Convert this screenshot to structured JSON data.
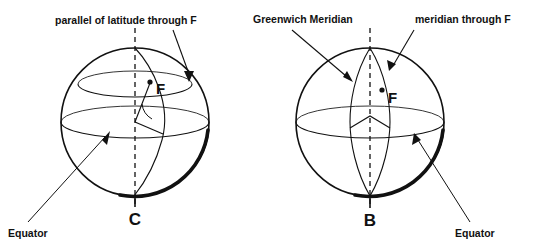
{
  "figure": {
    "background_color": "#ffffff",
    "line_color": "#111111",
    "width": 550,
    "height": 251
  },
  "diagrams": [
    {
      "id": "left-sphere",
      "name": "parallel-of-latitude-diagram",
      "sphere": {
        "cx": 135,
        "cy": 122,
        "r": 74
      },
      "pole_label": "C",
      "point_label": "F",
      "annotations": [
        {
          "name": "parallel-of-latitude-callout",
          "text": "parallel of latitude through F"
        },
        {
          "name": "equator-callout",
          "text": "Equator"
        }
      ]
    },
    {
      "id": "right-sphere",
      "name": "meridian-diagram",
      "sphere": {
        "cx": 370,
        "cy": 122,
        "r": 74
      },
      "pole_label": "B",
      "point_label": "F",
      "annotations": [
        {
          "name": "greenwich-meridian-callout",
          "text": "Greenwich Meridian"
        },
        {
          "name": "meridian-through-f-callout",
          "text": "meridian through F"
        },
        {
          "name": "equator-callout",
          "text": "Equator"
        }
      ]
    }
  ],
  "labels": {
    "parallel_of_latitude": "parallel of latitude through F",
    "equator_left": "Equator",
    "pole_c": "C",
    "point_f_left": "F",
    "greenwich_meridian": "Greenwich Meridian",
    "meridian_through_f": "meridian through F",
    "equator_right": "Equator",
    "pole_b": "B",
    "point_f_right": "F"
  }
}
